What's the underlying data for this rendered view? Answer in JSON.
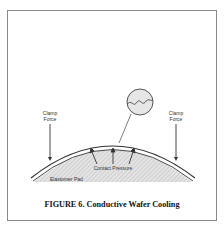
{
  "figure": {
    "caption": "FIGURE 6.  Conductive Wafer Cooling",
    "labels": {
      "clamp_force_left": [
        "Clamp",
        "Force"
      ],
      "clamp_force_right": [
        "Clamp",
        "Force"
      ],
      "contact_pressure": "Contact Pressure",
      "elastomer_pad": "Elastomer Pad"
    },
    "colors": {
      "line": "#333333",
      "pad_fill": "#d8d8d8",
      "frame": "#8a8a8a"
    }
  }
}
